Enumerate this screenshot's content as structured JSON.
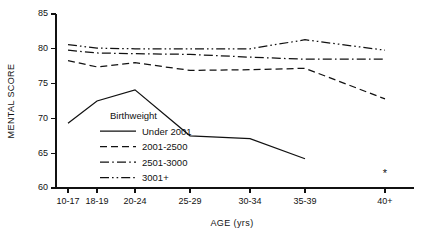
{
  "chart_data": {
    "type": "line",
    "title": "",
    "xlabel": "AGE (yrs)",
    "ylabel": "MENTAL SCORE",
    "categories": [
      "10-17",
      "18-19",
      "20-24",
      "25-29",
      "30-34",
      "35-39",
      "40+"
    ],
    "ylim": [
      60,
      85
    ],
    "yticks": [
      60,
      65,
      70,
      75,
      80,
      85
    ],
    "ytick_labels": [
      "60",
      "65",
      "70",
      "75",
      "80",
      "85"
    ],
    "grid": false,
    "legend_position": "inside-center-left",
    "legend_title": "Birthweight",
    "series": [
      {
        "name": "Under 2001",
        "dash": "solid",
        "color": "#111111",
        "values": [
          69.3,
          72.5,
          74.1,
          67.5,
          67.1,
          64.2,
          null
        ]
      },
      {
        "name": "2001-2500",
        "dash": "dashed",
        "color": "#111111",
        "values": [
          78.3,
          77.4,
          78.0,
          76.9,
          77.0,
          77.2,
          72.8
        ]
      },
      {
        "name": "2501-3000",
        "dash": "dashdot",
        "color": "#111111",
        "values": [
          79.8,
          79.4,
          79.3,
          79.2,
          78.8,
          78.5,
          78.5
        ]
      },
      {
        "name": "3001+",
        "dash": "dashdotdot",
        "color": "#111111",
        "values": [
          80.6,
          80.1,
          80.0,
          80.0,
          80.0,
          81.3,
          79.8
        ]
      }
    ],
    "annotations": [
      {
        "name": "asterisk-marker",
        "text": "*",
        "category": "40+",
        "value": 61.6
      }
    ]
  },
  "axis": {
    "y_label": "MENTAL SCORE",
    "x_label": "AGE (yrs)"
  }
}
